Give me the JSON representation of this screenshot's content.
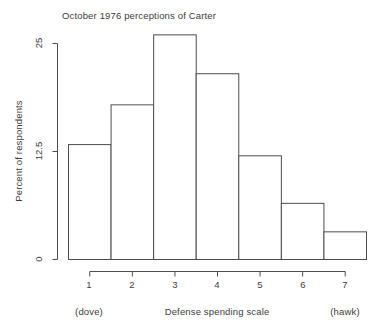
{
  "chart_data": {
    "type": "bar",
    "title": "October 1976 perceptions of Carter",
    "xlabel": "Defense spending scale",
    "ylabel": "Percent of respondents",
    "xlabel_left_anchor": "(dove)",
    "xlabel_right_anchor": "(hawk)",
    "categories": [
      "1",
      "2",
      "3",
      "4",
      "5",
      "6",
      "7"
    ],
    "values": [
      13.3,
      17.9,
      26.0,
      21.5,
      12.0,
      6.5,
      3.2
    ],
    "ylim": [
      0,
      26.5
    ],
    "xlim": [
      0.5,
      7.5
    ],
    "yticks": [
      "0",
      "12.5",
      "25"
    ],
    "ytick_values": [
      0,
      12.5,
      25
    ],
    "xticks": [
      "1",
      "2",
      "3",
      "4",
      "5",
      "6",
      "7"
    ],
    "grid": false,
    "legend": false,
    "bar_fill": "#ffffff",
    "bar_border": "#4d4d4d",
    "axis_color": "#4d4d4d",
    "background": "#ffffff"
  }
}
